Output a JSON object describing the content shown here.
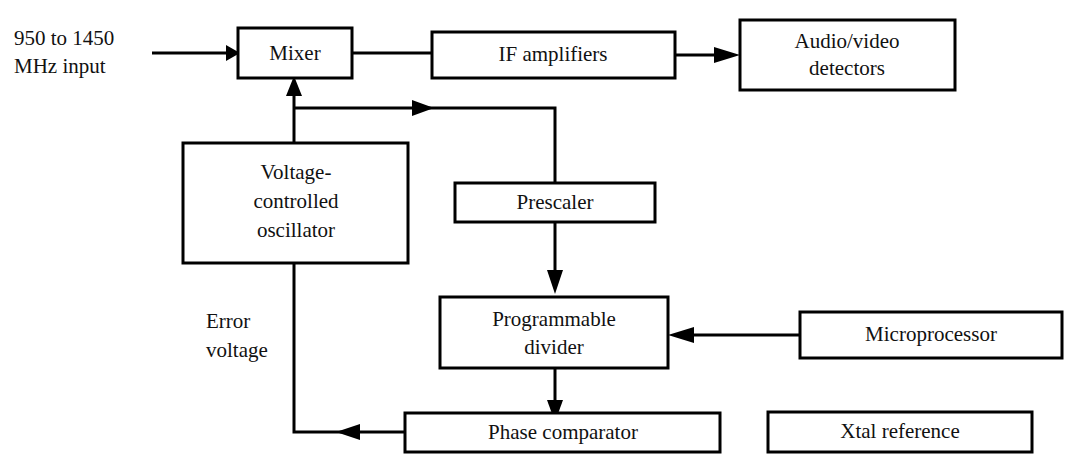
{
  "diagram": {
    "type": "block-diagram",
    "canvas": {
      "width": 1082,
      "height": 468
    },
    "background_color": "#ffffff",
    "line_color": "#000000",
    "text_color": "#111111",
    "blocks": [
      {
        "id": "mixer",
        "label": "Mixer",
        "lines": [
          "Mixer"
        ],
        "x": 238,
        "y": 28,
        "w": 114,
        "h": 50
      },
      {
        "id": "if-amplifiers",
        "label": "IF amplifiers",
        "lines": [
          "IF amplifiers"
        ],
        "x": 432,
        "y": 32,
        "w": 243,
        "h": 46
      },
      {
        "id": "audio-video-detectors",
        "label": "Audio/video detectors",
        "lines": [
          "Audio/video",
          "detectors"
        ],
        "x": 740,
        "y": 20,
        "w": 215,
        "h": 70
      },
      {
        "id": "voltage-controlled-oscillator",
        "label": "Voltage-controlled oscillator",
        "lines": [
          "Voltage-",
          "controlled",
          "oscillator"
        ],
        "x": 183,
        "y": 143,
        "w": 225,
        "h": 120
      },
      {
        "id": "prescaler",
        "label": "Prescaler",
        "lines": [
          "Prescaler"
        ],
        "x": 455,
        "y": 183,
        "w": 200,
        "h": 39
      },
      {
        "id": "programmable-divider",
        "label": "Programmable divider",
        "lines": [
          "Programmable",
          "divider"
        ],
        "x": 440,
        "y": 297,
        "w": 228,
        "h": 71
      },
      {
        "id": "microprocessor",
        "label": "Microprocessor",
        "lines": [
          "Microprocessor"
        ],
        "x": 800,
        "y": 312,
        "w": 262,
        "h": 46
      },
      {
        "id": "phase-comparator",
        "label": "Phase comparator",
        "lines": [
          "Phase comparator"
        ],
        "x": 405,
        "y": 413,
        "w": 315,
        "h": 39
      },
      {
        "id": "xtal-reference",
        "label": "Xtal reference",
        "lines": [
          "Xtal reference"
        ],
        "x": 768,
        "y": 412,
        "w": 264,
        "h": 40
      }
    ],
    "free_labels": [
      {
        "id": "input-signal-label",
        "lines": [
          "950 to 1450",
          "MHz input"
        ],
        "x": 14,
        "y": 30
      },
      {
        "id": "error-voltage-label",
        "lines": [
          "Error",
          "voltage"
        ],
        "x": 206,
        "y": 313
      }
    ],
    "connections": [
      {
        "id": "input-to-mixer",
        "from": "input-signal",
        "to": "mixer",
        "arrow": true
      },
      {
        "id": "mixer-to-if-amplifiers",
        "from": "mixer",
        "to": "if-amplifiers",
        "arrow": false
      },
      {
        "id": "if-amplifiers-to-detectors",
        "from": "if-amplifiers",
        "to": "audio-video-detectors",
        "arrow": true
      },
      {
        "id": "vco-to-mixer",
        "from": "voltage-controlled-oscillator",
        "to": "mixer",
        "arrow": true
      },
      {
        "id": "vco-to-prescaler",
        "from": "voltage-controlled-oscillator",
        "to": "prescaler",
        "arrow": true
      },
      {
        "id": "prescaler-to-programmable-divider",
        "from": "prescaler",
        "to": "programmable-divider",
        "arrow": true
      },
      {
        "id": "microprocessor-to-programmable-divider",
        "from": "microprocessor",
        "to": "programmable-divider",
        "arrow": true
      },
      {
        "id": "programmable-divider-to-phase-comparator",
        "from": "programmable-divider",
        "to": "phase-comparator",
        "arrow": true
      },
      {
        "id": "phase-comparator-to-vco",
        "from": "phase-comparator",
        "to": "voltage-controlled-oscillator",
        "arrow": true,
        "label": "Error voltage"
      }
    ]
  }
}
